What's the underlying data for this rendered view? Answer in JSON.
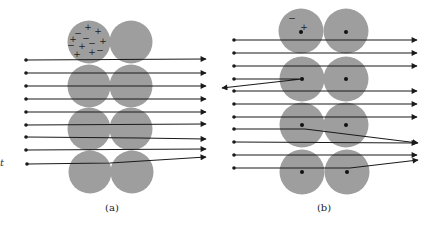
{
  "figure": {
    "colors": {
      "atom": "#9e9e9e",
      "ray": "#1a1a1a",
      "nucleus": "#111111",
      "background": "#ffffff"
    },
    "left_fragment": "t",
    "panels": [
      {
        "id": "a",
        "label": "(a)",
        "model": "plum-pudding",
        "atom_radius": 21.5,
        "atoms": [
          {
            "cx": 89,
            "cy": 42
          },
          {
            "cx": 131,
            "cy": 42
          },
          {
            "cx": 89,
            "cy": 86
          },
          {
            "cx": 131,
            "cy": 86
          },
          {
            "cx": 89,
            "cy": 129
          },
          {
            "cx": 131,
            "cy": 129
          },
          {
            "cx": 90,
            "cy": 172
          },
          {
            "cx": 132,
            "cy": 172
          }
        ],
        "charges": [
          {
            "sign": "+",
            "x": 88,
            "y": 27
          },
          {
            "sign": "+",
            "x": 98,
            "y": 31
          },
          {
            "sign": "+",
            "x": 73,
            "y": 39
          },
          {
            "sign": "+",
            "x": 103,
            "y": 41
          },
          {
            "sign": "+",
            "x": 82,
            "y": 46
          },
          {
            "sign": "+",
            "x": 92,
            "y": 52
          },
          {
            "sign": "+",
            "x": 77,
            "y": 54
          },
          {
            "sign": "−",
            "x": 78,
            "y": 33
          },
          {
            "sign": "−",
            "x": 86,
            "y": 38
          },
          {
            "sign": "−",
            "x": 92,
            "y": 43
          },
          {
            "sign": "−",
            "x": 100,
            "y": 50
          },
          {
            "sign": "−",
            "x": 71,
            "y": 45
          }
        ],
        "rays": [
          {
            "points": [
              [
                26,
                60
              ],
              [
                206,
                59
              ]
            ]
          },
          {
            "points": [
              [
                26,
                73
              ],
              [
                206,
                73
              ]
            ]
          },
          {
            "points": [
              [
                26,
                86
              ],
              [
                206,
                86
              ]
            ]
          },
          {
            "points": [
              [
                26,
                99
              ],
              [
                206,
                99
              ]
            ]
          },
          {
            "points": [
              [
                26,
                112
              ],
              [
                206,
                112
              ]
            ]
          },
          {
            "points": [
              [
                26,
                125
              ],
              [
                206,
                124
              ]
            ]
          },
          {
            "points": [
              [
                26,
                137
              ],
              [
                140,
                138
              ],
              [
                206,
                139
              ]
            ]
          },
          {
            "points": [
              [
                26,
                150
              ],
              [
                206,
                149
              ]
            ]
          },
          {
            "points": [
              [
                27,
                164
              ],
              [
                110,
                163
              ],
              [
                206,
                157
              ]
            ]
          }
        ]
      },
      {
        "id": "b",
        "label": "(b)",
        "model": "nuclear",
        "atom_radius": 22.5,
        "atoms": [
          {
            "cx": 301,
            "cy": 31,
            "nx": 301,
            "ny": 32
          },
          {
            "cx": 346,
            "cy": 31,
            "nx": 346,
            "ny": 32
          },
          {
            "cx": 302,
            "cy": 79,
            "nx": 302,
            "ny": 79
          },
          {
            "cx": 346,
            "cy": 79,
            "nx": 346,
            "ny": 79
          },
          {
            "cx": 302,
            "cy": 125,
            "nx": 302,
            "ny": 125
          },
          {
            "cx": 346,
            "cy": 125,
            "nx": 346,
            "ny": 125
          },
          {
            "cx": 302,
            "cy": 172,
            "nx": 302,
            "ny": 172
          },
          {
            "cx": 347,
            "cy": 172,
            "nx": 347,
            "ny": 172
          }
        ],
        "charges": [
          {
            "sign": "−",
            "x": 292,
            "y": 18
          },
          {
            "sign": "+",
            "x": 304,
            "y": 27
          }
        ],
        "rays": [
          {
            "points": [
              [
                234,
                40
              ],
              [
                417,
                40
              ]
            ]
          },
          {
            "points": [
              [
                234,
                53
              ],
              [
                417,
                53
              ]
            ]
          },
          {
            "points": [
              [
                234,
                66
              ],
              [
                417,
                66
              ]
            ]
          },
          {
            "points": [
              [
                234,
                79
              ],
              [
                302,
                79
              ],
              [
                222,
                88
              ]
            ]
          },
          {
            "points": [
              [
                234,
                91
              ],
              [
                417,
                91
              ]
            ]
          },
          {
            "points": [
              [
                234,
                104
              ],
              [
                417,
                104
              ]
            ]
          },
          {
            "points": [
              [
                234,
                117
              ],
              [
                417,
                117
              ]
            ]
          },
          {
            "points": [
              [
                234,
                129
              ],
              [
                305,
                129
              ],
              [
                418,
                143
              ]
            ]
          },
          {
            "points": [
              [
                234,
                142
              ],
              [
                417,
                143
              ]
            ]
          },
          {
            "points": [
              [
                234,
                155
              ],
              [
                417,
                155
              ]
            ]
          },
          {
            "points": [
              [
                234,
                168
              ],
              [
                350,
                168
              ],
              [
                418,
                160
              ]
            ]
          }
        ]
      }
    ],
    "label_positions": {
      "a": {
        "x": 112,
        "y": 211
      },
      "b": {
        "x": 324,
        "y": 211
      },
      "fragment": {
        "x": 0,
        "y": 166
      }
    }
  }
}
